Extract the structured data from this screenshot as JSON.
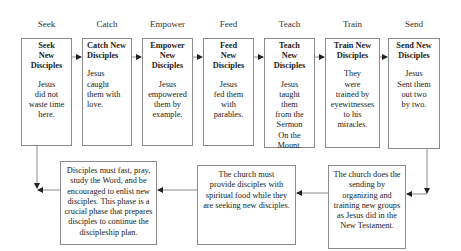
{
  "phases": [
    {
      "label": "Seek",
      "title": "Seek\nNew\nDisciples",
      "body": "Jesus\ndid not\nwaste time\nhere."
    },
    {
      "label": "Catch",
      "title": "Catch New\nDisciples",
      "body": "Jesus\ncaught\nthem with\nlove."
    },
    {
      "label": "Empower",
      "title": "Empower\nNew\nDisciples",
      "body": "Jesus\nempowered\nthem by\nexample."
    },
    {
      "label": "Feed",
      "title": "Feed\nNew\nDisciples",
      "body": "Jesus\nfed them\nwith\nparables."
    },
    {
      "label": "Teach",
      "title": "Teach\nNew\nDisciples",
      "body": "Jesus\ntaught\nthem\nfrom the\nSermon\nOn the\nMount."
    },
    {
      "label": "Train",
      "title": "Train New\nDisciples",
      "body": "They\nwere\ntrained by\neyewitnesses\nto his\nmiracles."
    },
    {
      "label": "Send",
      "title": "Send New\nDisciples",
      "body": "Jesus\nSent them\nout two\nby two."
    }
  ],
  "bottom": {
    "left": "Disciples must fast, pray,\nstudy the Word, and be\nencouraged to enlist new\ndisciples. This phase is a\ncrucial phase that prepares\ndisciples to continue the\ndiscipleship plan.",
    "middle": "The church must\nprovide disciples with\nspiritual food while they\nare seeking new disciples.",
    "right": "The church does the\nsending by\norganizing and\ntraining new groups\nas Jesus did in the\nNew Testament."
  },
  "colors": {
    "line": "#8a8a8a",
    "arrow": "#222222"
  }
}
